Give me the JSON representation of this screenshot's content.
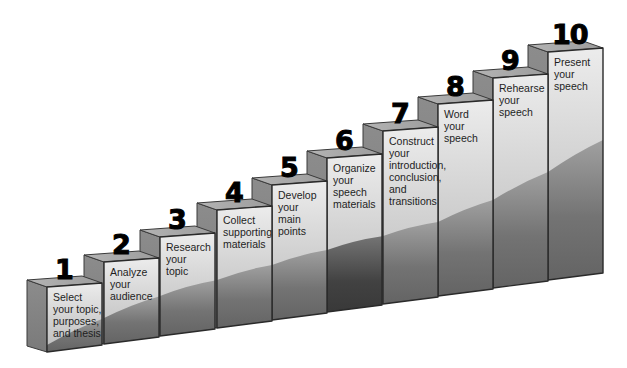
{
  "diagram": {
    "type": "staircase",
    "colors": {
      "front_top": "#e4e4e4",
      "front_mid": "#c4c4c4",
      "band_light": "#a8a8a8",
      "band_dark": "#4a4a4a",
      "side_face": "#858585",
      "top_cap": "#a2a2a2",
      "edge": "#2e2e2e",
      "number": "#000000"
    },
    "steps": [
      {
        "number": "1",
        "label": "Select\nyour topic,\npurposes,\nand thesis"
      },
      {
        "number": "2",
        "label": "Analyze\nyour\naudience"
      },
      {
        "number": "3",
        "label": "Research\nyour\ntopic"
      },
      {
        "number": "4",
        "label": "Collect\nsupporting\nmaterials"
      },
      {
        "number": "5",
        "label": "Develop\nyour\nmain\npoints"
      },
      {
        "number": "6",
        "label": "Organize\nyour\nspeech\nmaterials"
      },
      {
        "number": "7",
        "label": "Construct\nyour\nintroduction,\nconclusion,\nand\ntransitions"
      },
      {
        "number": "8",
        "label": "Word\nyour\nspeech"
      },
      {
        "number": "9",
        "label": "Rehearse\nyour\nspeech"
      },
      {
        "number": "10",
        "label": "Present\nyour\nspeech"
      }
    ]
  }
}
